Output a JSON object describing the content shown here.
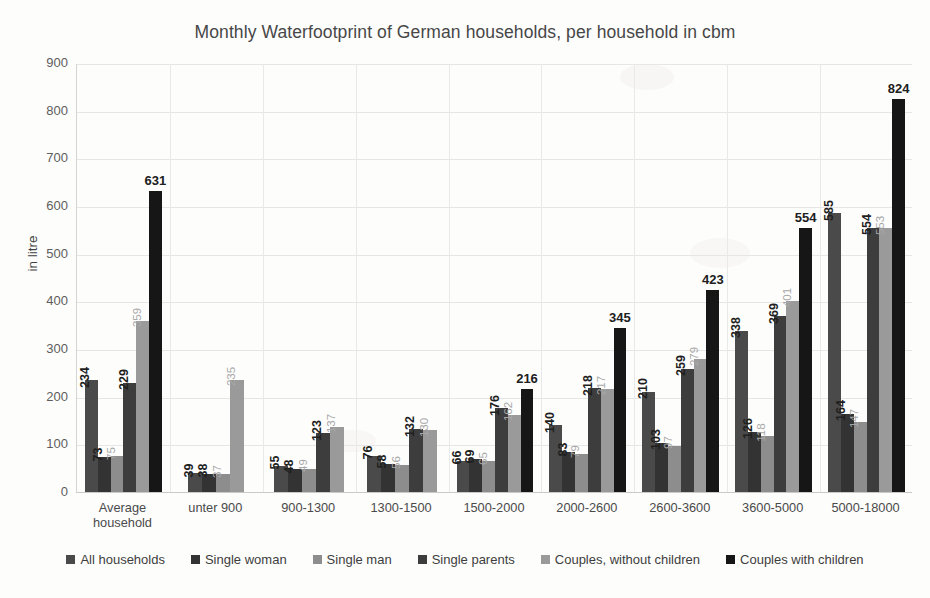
{
  "chart_data": {
    "type": "bar",
    "title": "Monthly Waterfootprint of German households, per household in cbm",
    "xlabel": "",
    "ylabel": "in litre",
    "ylim": [
      0,
      900
    ],
    "ytick_step": 100,
    "yticks": [
      900,
      800,
      700,
      600,
      500,
      400,
      300,
      200,
      100,
      0
    ],
    "grid": true,
    "legend_position": "bottom",
    "categories": [
      "Average household",
      "unter 900",
      "900-1300",
      "1300-1500",
      "1500-2000",
      "2000-2600",
      "2600-3600",
      "3600-5000",
      "5000-18000"
    ],
    "series": [
      {
        "name": "All households",
        "color": "#4a4a4a",
        "values": [
          234,
          39,
          55,
          76,
          66,
          140,
          210,
          338,
          585
        ]
      },
      {
        "name": "Single woman",
        "color": "#333333",
        "values": [
          73,
          38,
          48,
          58,
          69,
          83,
          103,
          126,
          164
        ]
      },
      {
        "name": "Single man",
        "color": "#8d8d8d",
        "values": [
          75,
          37,
          49,
          56,
          65,
          79,
          97,
          118,
          147
        ]
      },
      {
        "name": "Single parents",
        "color": "#3d3d3d",
        "values": [
          229,
          0,
          123,
          132,
          176,
          218,
          259,
          369,
          554
        ]
      },
      {
        "name": "Couples, without children",
        "color": "#9a9a9a",
        "values": [
          359,
          235,
          137,
          130,
          162,
          217,
          279,
          401,
          553
        ]
      },
      {
        "name": "Couples with children",
        "color": "#161616",
        "values": [
          631,
          0,
          0,
          0,
          216,
          345,
          423,
          554,
          824
        ]
      }
    ]
  },
  "axis": {
    "y_title": "in litre"
  }
}
